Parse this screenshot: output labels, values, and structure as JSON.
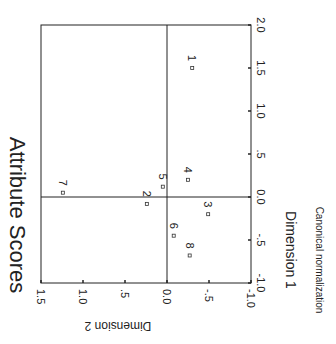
{
  "chart_data": {
    "type": "scatter",
    "title": "Attribute Scores",
    "xlabel": "Dimension 1",
    "ylabel": "Dimension 2",
    "footnote": "Canonical normalization",
    "orientation_note": "figure rotated 90 degrees clockwise",
    "xlim": [
      -1.0,
      2.0
    ],
    "ylim": [
      -1.0,
      1.5
    ],
    "x_ticks": [
      "-1.0",
      "-.5",
      "0.0",
      ".5",
      "1.0",
      "1.5",
      "2.0"
    ],
    "x_tick_values": [
      -1.0,
      -0.5,
      0.0,
      0.5,
      1.0,
      1.5,
      2.0
    ],
    "y_ticks": [
      "-1.0",
      "-.5",
      "0.0",
      ".5",
      "1.0",
      "1.5"
    ],
    "y_tick_values": [
      -1.0,
      -0.5,
      0.0,
      0.5,
      1.0,
      1.5
    ],
    "reference_lines": {
      "x": 0.0,
      "y": 0.0
    },
    "grid": false,
    "legend": null,
    "points": [
      {
        "label": "1",
        "x": 1.5,
        "y": -0.3
      },
      {
        "label": "2",
        "x": -0.08,
        "y": 0.24
      },
      {
        "label": "3",
        "x": -0.2,
        "y": -0.49
      },
      {
        "label": "4",
        "x": 0.2,
        "y": -0.25
      },
      {
        "label": "5",
        "x": 0.12,
        "y": 0.05
      },
      {
        "label": "6",
        "x": -0.45,
        "y": -0.08
      },
      {
        "label": "7",
        "x": 0.05,
        "y": 1.24
      },
      {
        "label": "8",
        "x": -0.68,
        "y": -0.27
      }
    ]
  },
  "colors": {
    "axis": "#222222",
    "marker": "#333333",
    "background": "#ffffff"
  }
}
